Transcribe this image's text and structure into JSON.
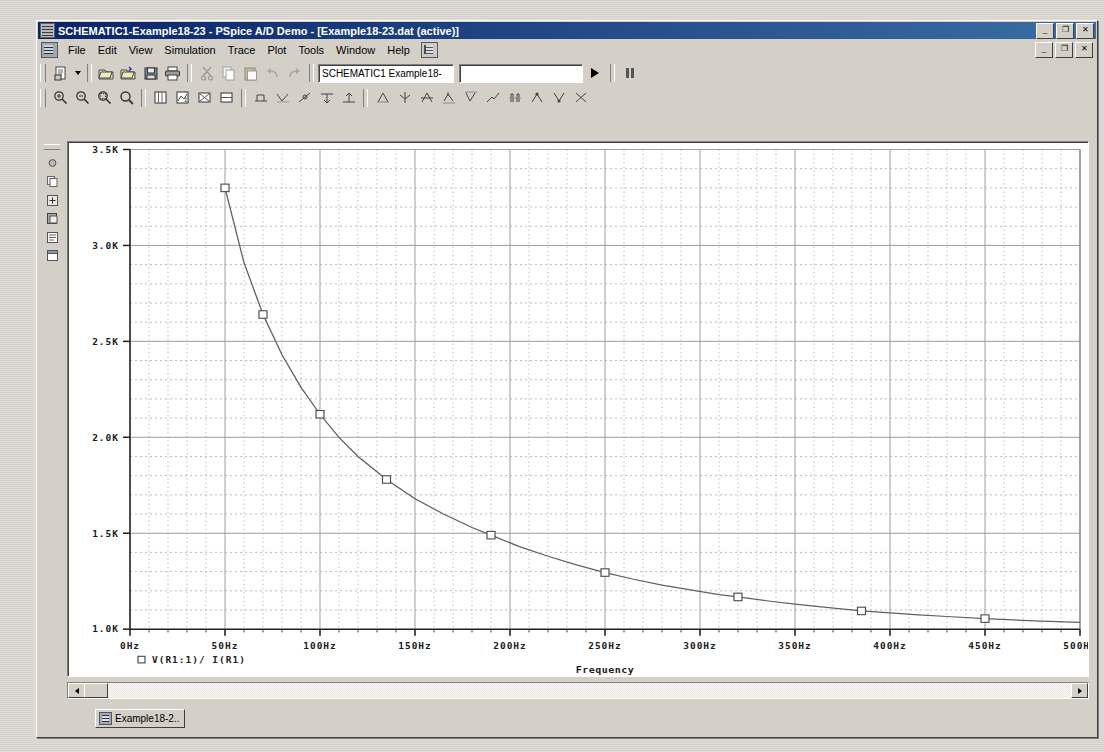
{
  "window": {
    "title": "SCHEMATIC1-Example18-23 - PSpice A/D Demo  - [Example18-23.dat (active)]",
    "app_icon": "pspice-icon",
    "buttons": {
      "minimize": "_",
      "restore": "❐",
      "close": "✕"
    }
  },
  "menu": {
    "doc_icon": "document-icon",
    "end_icon": "probe-icon",
    "items": [
      "File",
      "Edit",
      "View",
      "Simulation",
      "Trace",
      "Plot",
      "Tools",
      "Window",
      "Help"
    ]
  },
  "toolbar_main": {
    "new_label": "new-file",
    "dropdown_label": "new-dropdown",
    "open_label": "open-file",
    "open_sim_label": "open-simulation",
    "save_label": "save",
    "print_label": "print",
    "cut_label": "cut",
    "copy_label": "copy",
    "paste_label": "paste",
    "undo_label": "undo",
    "redo_label": "redo",
    "profile_value": "SCHEMATIC1 Example18-",
    "sim_field_value": "",
    "run_label": "run-simulation",
    "pause_label": "pause-simulation"
  },
  "toolbar_plot": {
    "items": [
      "zoom-in-icon",
      "zoom-out-icon",
      "zoom-area-icon",
      "zoom-fit-icon",
      "add-plot-icon",
      "add-trace-icon",
      "delete-plot-icon",
      "toggle-cursor-icon",
      "cursor-peak-icon",
      "cursor-trough-icon",
      "cursor-slope-icon",
      "cursor-min-icon",
      "cursor-max-icon",
      "mark-label-icon",
      "mark-point-icon",
      "search-commands-icon",
      "mark-max-icon",
      "mark-min-icon",
      "mark-slope-icon",
      "mark-avg-icon",
      "mark-peak-icon",
      "mark-trough-icon",
      "mark-cross-icon"
    ]
  },
  "vertical_toolbar": {
    "items": [
      "file-icon",
      "copy-icon",
      "add-trace-icon",
      "paste-icon",
      "list-icon",
      "window-icon"
    ]
  },
  "scrollbar": {
    "left_arrow": "scroll-left",
    "right_arrow": "scroll-right",
    "thumb": "scroll-thumb"
  },
  "taskbar": {
    "tab_label": "Example18-2..",
    "tab_icon": "window-icon"
  },
  "chart_data": {
    "type": "line",
    "title": "",
    "xlabel": "Frequency",
    "ylabel": "",
    "xlim": [
      0,
      500
    ],
    "ylim": [
      1000,
      3500
    ],
    "grid": true,
    "x_ticks": [
      "0Hz",
      "50Hz",
      "100Hz",
      "150Hz",
      "200Hz",
      "250Hz",
      "300Hz",
      "350Hz",
      "400Hz",
      "450Hz",
      "500Hz"
    ],
    "x_tick_values": [
      0,
      50,
      100,
      150,
      200,
      250,
      300,
      350,
      400,
      450,
      500
    ],
    "y_ticks": [
      "1.0K",
      "1.5K",
      "2.0K",
      "2.5K",
      "3.0K",
      "3.5K"
    ],
    "y_tick_values": [
      1000,
      1500,
      2000,
      2500,
      3000,
      3500
    ],
    "x_minor_step": 10,
    "y_minor_step": 100,
    "legend_position": "bottom-left",
    "series": [
      {
        "name": "V(R1:1)/ I(R1)",
        "marker": "square",
        "color": "#606060",
        "x": [
          50,
          60,
          70,
          80,
          90,
          100,
          110,
          120,
          135,
          150,
          165,
          180,
          190,
          205,
          220,
          235,
          250,
          265,
          280,
          295,
          310,
          320,
          335,
          350,
          365,
          385,
          400,
          415,
          430,
          450,
          465,
          480,
          500
        ],
        "y": [
          3300,
          2910,
          2640,
          2430,
          2260,
          2120,
          2000,
          1900,
          1780,
          1680,
          1600,
          1530,
          1490,
          1430,
          1380,
          1335,
          1295,
          1260,
          1230,
          1205,
          1180,
          1168,
          1148,
          1130,
          1115,
          1095,
          1085,
          1075,
          1066,
          1055,
          1048,
          1042,
          1035
        ],
        "marker_x": [
          50,
          70,
          100,
          135,
          190,
          250,
          320,
          385,
          450
        ],
        "marker_y": [
          3300,
          2640,
          2120,
          1780,
          1490,
          1295,
          1168,
          1095,
          1055
        ]
      }
    ]
  },
  "legend": {
    "symbol": "square-marker",
    "text": "V(R1:1)/ I(R1)"
  }
}
